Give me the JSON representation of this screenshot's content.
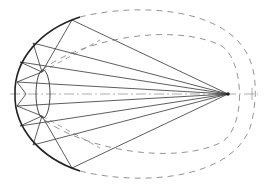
{
  "diagram": {
    "kind": "optical reflector ray diagram",
    "colors": {
      "background": "#ffffff",
      "solid_line": "#333333",
      "bold_curve": "#222222",
      "dashed_line": "#888888",
      "axis_line": "#999999"
    },
    "focal_point": {
      "x": 228,
      "y": 94
    },
    "axis": {
      "x1": 10,
      "y1": 94,
      "x2": 258,
      "y2": 94,
      "style": "dash-dot"
    },
    "reflector_arc": {
      "d": "M 80 17 C 40 30, 14 60, 15 94 C 14 128, 40 158, 80 171",
      "style": "bold solid"
    },
    "outer_dashed_ellipse": {
      "d": "M 80 17 C 140 2, 230 8, 250 60 C 258 80, 256 108, 250 128 C 230 180, 140 186, 80 171",
      "style": "dashed"
    },
    "inner_dashed_ellipse": {
      "d": "M 42 70 C 80 40, 170 22, 220 45 C 245 58, 247 130, 220 143 C 170 166, 80 148, 42 118",
      "style": "dashed"
    },
    "small_ellipse": {
      "cx": 43,
      "cy": 94,
      "rx": 7,
      "ry": 24
    },
    "rays": [
      {
        "x1": 228,
        "y1": 94,
        "x2": 72,
        "y2": 20
      },
      {
        "x1": 228,
        "y1": 94,
        "x2": 33,
        "y2": 43
      },
      {
        "x1": 228,
        "y1": 94,
        "x2": 20,
        "y2": 62
      },
      {
        "x1": 228,
        "y1": 94,
        "x2": 17,
        "y2": 82
      },
      {
        "x1": 228,
        "y1": 94,
        "x2": 17,
        "y2": 106
      },
      {
        "x1": 228,
        "y1": 94,
        "x2": 20,
        "y2": 126
      },
      {
        "x1": 228,
        "y1": 94,
        "x2": 33,
        "y2": 145
      },
      {
        "x1": 228,
        "y1": 94,
        "x2": 72,
        "y2": 168
      }
    ],
    "reflected_segments": [
      {
        "x1": 72,
        "y1": 20,
        "x2": 42,
        "y2": 72
      },
      {
        "x1": 33,
        "y1": 43,
        "x2": 42,
        "y2": 72
      },
      {
        "x1": 20,
        "y1": 62,
        "x2": 42,
        "y2": 72
      },
      {
        "x1": 42,
        "y1": 72,
        "x2": 17,
        "y2": 82
      },
      {
        "x1": 17,
        "y1": 82,
        "x2": 26,
        "y2": 94
      },
      {
        "x1": 26,
        "y1": 94,
        "x2": 17,
        "y2": 106
      },
      {
        "x1": 17,
        "y1": 106,
        "x2": 42,
        "y2": 116
      },
      {
        "x1": 20,
        "y1": 126,
        "x2": 42,
        "y2": 116
      },
      {
        "x1": 33,
        "y1": 145,
        "x2": 42,
        "y2": 116
      },
      {
        "x1": 72,
        "y1": 168,
        "x2": 42,
        "y2": 116
      }
    ],
    "dashed_guides": [
      {
        "x1": 42,
        "y1": 72,
        "x2": 100,
        "y2": 40
      },
      {
        "x1": 42,
        "y1": 116,
        "x2": 100,
        "y2": 148
      }
    ],
    "right_tick": {
      "x1": 252,
      "y1": 88,
      "x2": 252,
      "y2": 100
    }
  }
}
